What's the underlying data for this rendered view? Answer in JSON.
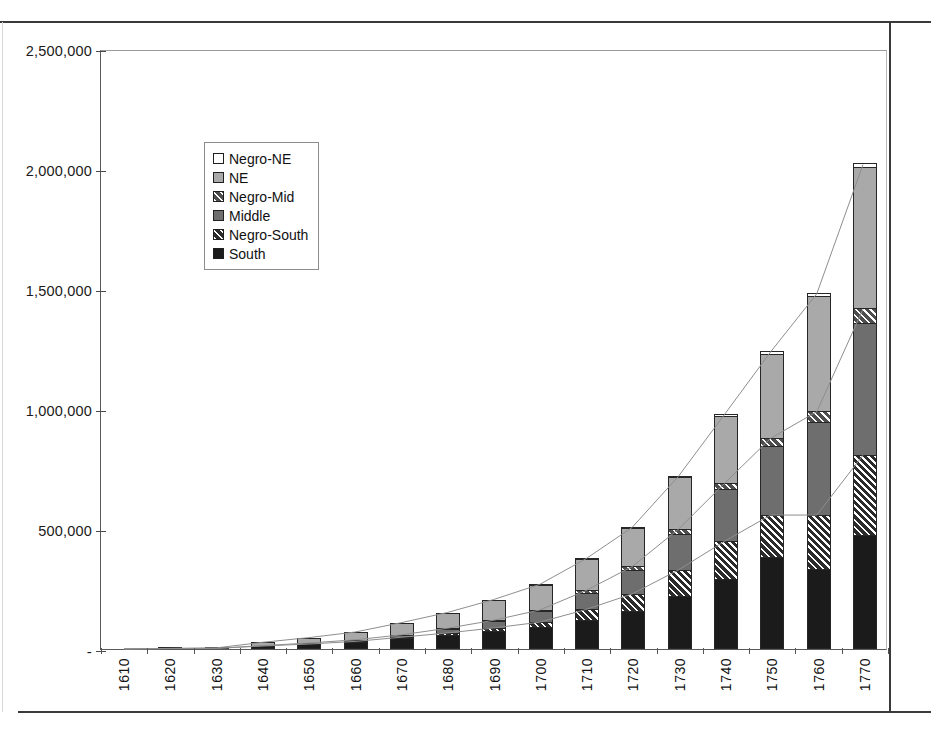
{
  "chart_data": {
    "type": "bar",
    "subtype": "stacked-bar-with-cumulative-lines",
    "title": "",
    "xlabel": "",
    "ylabel": "",
    "ylim": [
      0,
      2500000
    ],
    "ytick_values": [
      0,
      500000,
      1000000,
      1500000,
      2000000,
      2500000
    ],
    "ytick_labels": [
      "-",
      "500,000",
      "1,000,000",
      "1,500,000",
      "2,000,000",
      "2,500,000"
    ],
    "grid": false,
    "legend_position": "upper-left-inside",
    "categories": [
      "1610",
      "1620",
      "1630",
      "1640",
      "1650",
      "1660",
      "1670",
      "1680",
      "1690",
      "1700",
      "1710",
      "1720",
      "1730",
      "1740",
      "1750",
      "1760",
      "1770"
    ],
    "series": [
      {
        "name": "South",
        "fill": "black",
        "values": [
          350,
          2200,
          2500,
          12000,
          20000,
          30000,
          45000,
          60000,
          75000,
          90000,
          120000,
          160000,
          220000,
          290000,
          385000,
          335000,
          475000
        ]
      },
      {
        "name": "Negro-South",
        "fill": "hatch-on-dark",
        "values": [
          0,
          0,
          100,
          400,
          800,
          1700,
          4000,
          7000,
          13000,
          22000,
          45000,
          70000,
          110000,
          160000,
          175000,
          225000,
          335000
        ]
      },
      {
        "name": "Middle",
        "fill": "dark-gray",
        "values": [
          0,
          0,
          350,
          1500,
          4000,
          6000,
          9000,
          17000,
          28000,
          45000,
          70000,
          100000,
          150000,
          215000,
          285000,
          385000,
          550000
        ]
      },
      {
        "name": "Negro-Mid",
        "fill": "hatch-on-light",
        "values": [
          0,
          0,
          0,
          100,
          300,
          600,
          1200,
          2500,
          4000,
          6000,
          9000,
          14000,
          20000,
          27000,
          36000,
          47000,
          60000
        ]
      },
      {
        "name": "NE",
        "fill": "light-gray",
        "values": [
          0,
          100,
          1500,
          14000,
          22000,
          32000,
          50000,
          65000,
          85000,
          105000,
          130000,
          160000,
          215000,
          280000,
          350000,
          480000,
          590000
        ]
      },
      {
        "name": "Negro-NE",
        "fill": "white",
        "values": [
          0,
          0,
          0,
          100,
          200,
          400,
          700,
          1000,
          1500,
          2000,
          3000,
          4000,
          6000,
          8000,
          11000,
          13000,
          15000
        ]
      }
    ],
    "totals": [
      350,
      2300,
      4450,
      28100,
      47300,
      70700,
      109900,
      152500,
      206500,
      270000,
      377000,
      508000,
      721000,
      980000,
      1242000,
      1485000,
      2025000
    ],
    "annotations": "Three light cumulative trend lines are drawn across the tops of the South+Negro-South, the Middle+Negro-Mid, and the full stack."
  },
  "legend": {
    "items": [
      {
        "label": "Negro-NE",
        "swatch": "white"
      },
      {
        "label": "NE",
        "swatch": "light-gray"
      },
      {
        "label": "Negro-Mid",
        "swatch": "hatch-on-light"
      },
      {
        "label": "Middle",
        "swatch": "dark-gray"
      },
      {
        "label": "Negro-South",
        "swatch": "hatch-on-dark"
      },
      {
        "label": "South",
        "swatch": "black"
      }
    ]
  },
  "colors": {
    "south": "#1b1b1b",
    "negro_south": "#2b2b2b",
    "middle": "#6e6e6e",
    "negro_mid": "#b4b4b4",
    "ne": "#a9a9a9",
    "negro_ne": "#ffffff",
    "axis": "#595959",
    "frame": "#3a3a3a"
  }
}
